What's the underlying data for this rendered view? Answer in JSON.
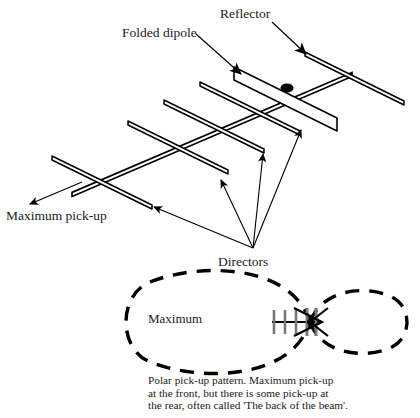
{
  "figure": {
    "background": "#ffffff",
    "ink": "#000000"
  },
  "labels": {
    "reflector": "Reflector",
    "folded_dipole": "Folded dipole",
    "maximum_pickup": "Maximum pick-up",
    "directors": "Directors",
    "maximum": "Maximum"
  },
  "caption": {
    "text": "Polar pick-up pattern. Maximum pick-up\nat the front, but there is some pick-up at\nthe rear, often called 'The back of the beam'."
  },
  "antenna": {
    "boom": {
      "from": [
        72,
        196
      ],
      "to": [
        352,
        76
      ]
    },
    "elements": [
      {
        "name": "reflector",
        "from": [
          305,
          53
        ],
        "to": [
          404,
          102
        ],
        "kind": "rod"
      },
      {
        "name": "folded-dipole",
        "from": [
          234,
          68
        ],
        "to": [
          337,
          119
        ],
        "kind": "loop"
      },
      {
        "name": "director-1",
        "from": [
          200,
          83
        ],
        "to": [
          300,
          132
        ],
        "kind": "rod"
      },
      {
        "name": "director-2",
        "from": [
          164,
          101
        ],
        "to": [
          264,
          150
        ],
        "kind": "rod"
      },
      {
        "name": "director-3",
        "from": [
          128,
          122
        ],
        "to": [
          228,
          171
        ],
        "kind": "rod"
      },
      {
        "name": "director-4",
        "from": [
          52,
          157
        ],
        "to": [
          152,
          206
        ],
        "kind": "rod"
      }
    ],
    "feed_point": [
      287,
      88
    ]
  },
  "polar_pattern": {
    "type": "figure-of-eight",
    "front_lobe": {
      "tip_x": 122,
      "centre_y": 322,
      "half_height": 53
    },
    "rear_lobe": {
      "tip_x": 412,
      "centre_y": 322,
      "half_height": 30
    },
    "crossing_point": [
      310,
      322
    ],
    "dash": "14 10"
  },
  "pointers": {
    "reflector_arrow": {
      "from": [
        272,
        22
      ],
      "to": [
        308,
        56
      ]
    },
    "dipole_arrow": {
      "from": [
        196,
        34
      ],
      "to": [
        243,
        76
      ]
    },
    "maxpickup_arrow": {
      "from": [
        80,
        183
      ],
      "to": [
        28,
        205
      ]
    },
    "director_arrows_origin": [
      253,
      248
    ],
    "director_arrow_tips": [
      [
        152,
        206
      ],
      [
        220,
        178
      ],
      [
        262,
        152
      ],
      [
        302,
        127
      ]
    ]
  }
}
